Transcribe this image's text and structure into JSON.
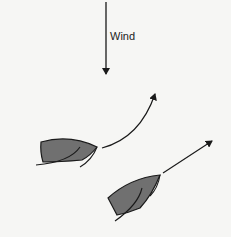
{
  "diagram": {
    "wind_label": "Wind",
    "colors": {
      "background": "#f6f6f4",
      "hull_fill": "#707070",
      "stroke": "#1a1a1a"
    },
    "elements": [
      {
        "id": "wind-arrow",
        "type": "arrow",
        "direction": "down",
        "label": "Wind"
      },
      {
        "id": "boat-1",
        "type": "sailboat",
        "heading": "right, curving upward (luffing up)"
      },
      {
        "id": "boat-1-path",
        "type": "curved-arrow"
      },
      {
        "id": "boat-2",
        "type": "sailboat",
        "heading": "up-right (close-hauled)"
      },
      {
        "id": "boat-2-path",
        "type": "straight-arrow"
      }
    ]
  }
}
